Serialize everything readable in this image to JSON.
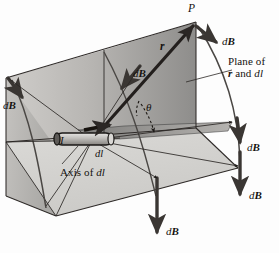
{
  "figure": {
    "colors": {
      "background": "#fdfdfd",
      "back_plane_light": "#d4d2cf",
      "back_plane_dark": "#9b9a98",
      "left_plane": "#b9b8b5",
      "floor_plane": "#d9d8d5",
      "mid_plane": "#a9a8a5",
      "line": "#2b2725",
      "arrow": "#3a3633",
      "wire_body": "#b4b2af",
      "wire_outline": "#1b1917",
      "text": "#14110f"
    }
  },
  "labels": {
    "point_p": "P",
    "r_vector": "r",
    "theta": "θ",
    "current": "I",
    "element": "dl",
    "axis_of": "Axis of ",
    "axis_element": "dl",
    "plane_line1": "Plane of",
    "plane_line2_pre": "",
    "plane_r": "r",
    "plane_mid": " and ",
    "plane_dl": "dl",
    "dB_top_right": "dB",
    "dB_left": "dB",
    "dB_middle": "dB",
    "dB_right_upper": "dB",
    "dB_right_lower": "dB",
    "dB_bottom": "dB",
    "dB_d": "d",
    "dB_B": "B"
  }
}
